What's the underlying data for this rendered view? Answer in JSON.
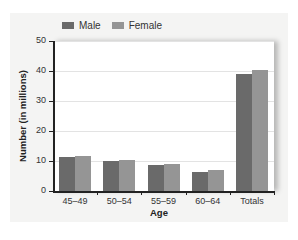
{
  "chart_data": {
    "type": "bar",
    "title": "",
    "xlabel": "Age",
    "ylabel": "Number (in millions)",
    "ylim": [
      0,
      50
    ],
    "yticks": [
      0,
      10,
      20,
      30,
      40,
      50
    ],
    "grid": true,
    "legend_position": "top-left",
    "categories": [
      "45–49",
      "50–54",
      "55–59",
      "60–64",
      "Totals"
    ],
    "series": [
      {
        "name": "Male",
        "color": "#6a6a6a",
        "values": [
          11.5,
          10.0,
          8.6,
          6.4,
          38.9
        ]
      },
      {
        "name": "Female",
        "color": "#959595",
        "values": [
          11.8,
          10.5,
          9.1,
          7.1,
          40.5
        ]
      }
    ]
  },
  "legend": {
    "male_label": "Male",
    "female_label": "Female"
  },
  "axes": {
    "x_title": "Age",
    "y_title": "Number (in millions)",
    "y_tick_labels": [
      "0",
      "10",
      "20",
      "30",
      "40",
      "50"
    ],
    "x_tick_labels": [
      "45–49",
      "50–54",
      "55–59",
      "60–64",
      "Totals"
    ]
  }
}
